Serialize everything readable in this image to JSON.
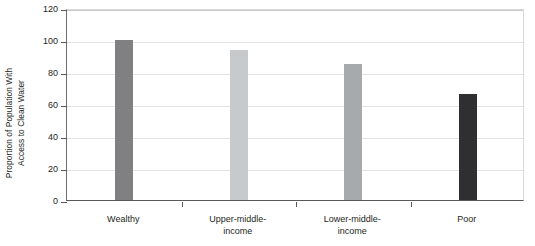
{
  "chart_data": {
    "type": "bar",
    "title": "",
    "subtitle": "",
    "xlabel": "",
    "ylabel": "Proportion of Population With\nAccess to Clean Water",
    "categories": [
      "Wealthy",
      "Upper-middle-\nincome",
      "Lower-middle-\nincome",
      "Poor"
    ],
    "values": [
      100,
      94,
      85,
      66
    ],
    "ylim": [
      0,
      120
    ],
    "ytick_values": [
      0,
      20,
      40,
      60,
      80,
      100,
      120
    ],
    "ytick_labels": [
      "0",
      "20",
      "40",
      "60",
      "80",
      "100",
      "120"
    ],
    "bar_colors": [
      "#808082",
      "#c8c9ca",
      "#a7a9ab",
      "#2f2f31"
    ],
    "grid": "horizontal",
    "legend": "none",
    "series": [
      {
        "name": "Proportion of Population With Access to Clean Water",
        "values": [
          100,
          94,
          85,
          66
        ]
      }
    ]
  },
  "axis": {
    "y_title_line1": "Proportion of Population With",
    "y_title_line2": "Access to Clean Water"
  },
  "style": {
    "background": "#ffffff",
    "axis_color": "#58595b",
    "gridline_color": "#e3e3e3",
    "text_color": "#231f20"
  }
}
